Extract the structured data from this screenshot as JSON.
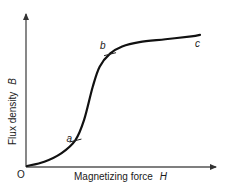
{
  "chart_data": {
    "type": "line",
    "title": "",
    "xlabel": "Magnetizing force",
    "xlabel_symbol": "H",
    "ylabel": "Flux density",
    "ylabel_symbol": "B",
    "origin_label": "O",
    "xlim": [
      0,
      10
    ],
    "ylim": [
      0,
      10
    ],
    "grid": false,
    "legend": "none",
    "series": [
      {
        "name": "B-H magnetization curve",
        "x": [
          0,
          1.0,
          2.0,
          2.8,
          3.3,
          3.8,
          4.2,
          4.8,
          5.5,
          6.5,
          8.0,
          9.5,
          10
        ],
        "y": [
          0,
          0.3,
          0.9,
          1.8,
          3.2,
          5.5,
          6.9,
          7.8,
          8.3,
          8.6,
          8.8,
          9.0,
          9.1
        ]
      }
    ],
    "annotations": [
      {
        "label": "a",
        "x": 2.8,
        "y": 1.8
      },
      {
        "label": "b",
        "x": 4.8,
        "y": 7.8
      },
      {
        "label": "c",
        "x": 10,
        "y": 9.1
      }
    ]
  }
}
